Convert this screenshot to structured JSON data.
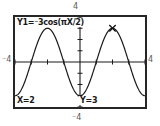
{
  "device": {
    "name": "graphing-calculator-screen",
    "screen_bg": "#ffffff",
    "ink": "#1a1a1a",
    "frame_color": "#262626"
  },
  "window_labels": {
    "top": "4",
    "bottom": "⁻4",
    "left": "⁻4",
    "right": "4"
  },
  "screen": {
    "equation_label": "Y1=⁻3cos(πX/2)",
    "trace_x_label": "X=2",
    "trace_y_label": "Y=3"
  },
  "chart_data": {
    "type": "line",
    "title": "Y1=⁻3cos(πX/2)",
    "xlabel": "",
    "ylabel": "",
    "xlim": [
      -4,
      4
    ],
    "ylim": [
      -4,
      4
    ],
    "grid": false,
    "axes_visible": true,
    "tick_marks": true,
    "x_tick_step": 1,
    "y_tick_step": 1,
    "legend": "none",
    "function": "y = -3*cos(pi*x/2)",
    "amplitude": 3,
    "period": 4,
    "series": [
      {
        "name": "Y1",
        "expression": "-3cos(πX/2)",
        "x": [
          -4,
          -3.75,
          -3.5,
          -3.25,
          -3,
          -2.75,
          -2.5,
          -2.25,
          -2,
          -1.75,
          -1.5,
          -1.25,
          -1,
          -0.75,
          -0.5,
          -0.25,
          0,
          0.25,
          0.5,
          0.75,
          1,
          1.25,
          1.5,
          1.75,
          2,
          2.25,
          2.5,
          2.75,
          3,
          3.25,
          3.5,
          3.75,
          4
        ],
        "y": [
          -3,
          -2.77,
          -2.12,
          -1.15,
          0,
          1.15,
          2.12,
          2.77,
          3,
          2.77,
          2.12,
          1.15,
          0,
          -1.15,
          -2.12,
          -2.77,
          -3,
          -2.77,
          -2.12,
          -1.15,
          0,
          1.15,
          2.12,
          2.77,
          3,
          2.77,
          2.12,
          1.15,
          0,
          -1.15,
          -2.12,
          -2.77,
          -3
        ]
      }
    ],
    "cursor": {
      "label": "trace-cursor",
      "glyph": "✕",
      "x": 2,
      "y": 3
    },
    "annotations": [
      {
        "name": "trace-x-readout",
        "text": "X=2",
        "position": "bottom-left"
      },
      {
        "name": "trace-y-readout",
        "text": "Y=3",
        "position": "bottom-center"
      }
    ]
  }
}
